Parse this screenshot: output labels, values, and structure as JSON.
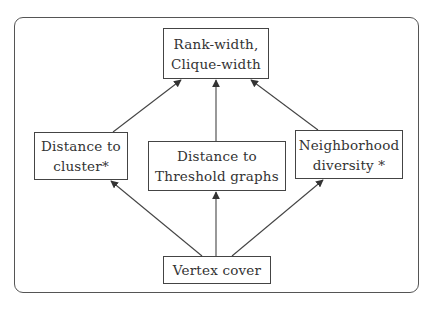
{
  "diagram": {
    "type": "parameter-hierarchy",
    "nodes": [
      {
        "id": "top",
        "lines": [
          "Rank-width,",
          "Clique-width"
        ]
      },
      {
        "id": "left",
        "lines": [
          "Distance to",
          "cluster*"
        ]
      },
      {
        "id": "mid",
        "lines": [
          "Distance to",
          "Threshold graphs"
        ]
      },
      {
        "id": "right",
        "lines": [
          "Neighborhood",
          "diversity *"
        ]
      },
      {
        "id": "bottom",
        "lines": [
          "Vertex cover"
        ]
      }
    ],
    "edges": [
      {
        "from": "left",
        "to": "top"
      },
      {
        "from": "mid",
        "to": "top"
      },
      {
        "from": "right",
        "to": "top"
      },
      {
        "from": "bottom",
        "to": "left"
      },
      {
        "from": "bottom",
        "to": "mid"
      },
      {
        "from": "bottom",
        "to": "right"
      }
    ],
    "colors": {
      "stroke": "#444444",
      "frame": "#555555",
      "text": "#333333",
      "background": "#ffffff"
    }
  }
}
